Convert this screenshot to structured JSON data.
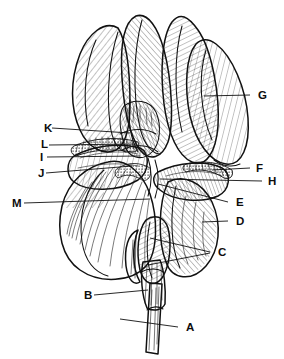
{
  "figure": {
    "background_color": "#ffffff",
    "ink_color": "#111111",
    "style": "pen-and-ink hatched botanical line drawing",
    "width": 284,
    "height": 359
  },
  "labels": [
    {
      "id": "A",
      "text": "A",
      "x": 186,
      "y": 331,
      "side": "right",
      "target_part": "stem",
      "leader": "M 178 327 L 120 319"
    },
    {
      "id": "B",
      "text": "B",
      "x": 84,
      "y": 299,
      "side": "left",
      "target_part": "pedicel",
      "leader": "M 94 295 L 148 290"
    },
    {
      "id": "C",
      "text": "C",
      "x": 218,
      "y": 256,
      "side": "right",
      "target_part": "spathe-bracts",
      "leader": "M 210 252 L 150 238 M 210 253 L 148 265"
    },
    {
      "id": "D",
      "text": "D",
      "x": 236,
      "y": 225,
      "side": "right",
      "target_part": "fall-petal-right",
      "leader": "M 228 221 L 202 222"
    },
    {
      "id": "E",
      "text": "E",
      "x": 236,
      "y": 206,
      "side": "right",
      "target_part": "style-branch-tip",
      "leader": "M 228 202 L 158 184"
    },
    {
      "id": "F",
      "text": "F",
      "x": 256,
      "y": 172,
      "side": "right",
      "target_part": "beard-right",
      "leader": "M 250 168 L 212 170"
    },
    {
      "id": "G",
      "text": "G",
      "x": 258,
      "y": 99,
      "side": "right",
      "target_part": "standard-petal-right",
      "leader": "M 250 95 L 204 96"
    },
    {
      "id": "H",
      "text": "H",
      "x": 268,
      "y": 185,
      "side": "right",
      "target_part": "haft-right",
      "leader": "M 262 181 L 160 179"
    },
    {
      "id": "I",
      "text": "I",
      "x": 40,
      "y": 161,
      "side": "left",
      "target_part": "style-arm-left",
      "leader": "M 47 157 L 140 156"
    },
    {
      "id": "J",
      "text": "J",
      "x": 38,
      "y": 177,
      "side": "left",
      "target_part": "haft-left",
      "leader": "M 46 173 L 132 166"
    },
    {
      "id": "K",
      "text": "K",
      "x": 44,
      "y": 132,
      "side": "left",
      "target_part": "stigma-crest",
      "leader": "M 52 128 L 130 133"
    },
    {
      "id": "L",
      "text": "L",
      "x": 41,
      "y": 148,
      "side": "left",
      "target_part": "beard-left",
      "leader": "M 49 145 L 136 144"
    },
    {
      "id": "M",
      "text": "M",
      "x": 12,
      "y": 207,
      "side": "left",
      "target_part": "fall-petal-left-base",
      "leader": "M 24 203 L 150 199"
    }
  ]
}
